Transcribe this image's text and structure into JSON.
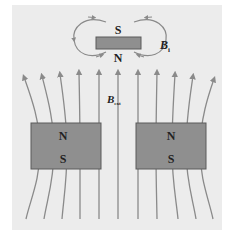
{
  "diagram": {
    "colors": {
      "background_panel": "#ececec",
      "magnet_fill": "#8f8f8f",
      "magnet_stroke": "#5a5a5a",
      "field_line": "#8a8a8a",
      "text": "#222222"
    },
    "small_magnet": {
      "top_pole": "S",
      "bottom_pole": "N",
      "field_label": "B",
      "field_label_subscript": "i"
    },
    "external_field": {
      "label": "B",
      "label_subscript": "ext"
    },
    "left_magnet": {
      "top_pole": "N",
      "bottom_pole": "S"
    },
    "right_magnet": {
      "top_pole": "N",
      "bottom_pole": "S"
    }
  }
}
